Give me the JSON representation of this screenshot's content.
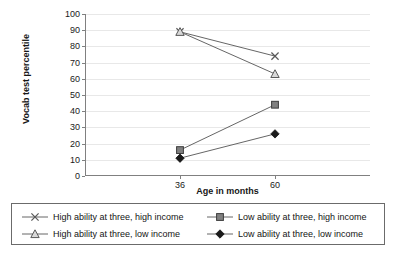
{
  "chart_data": {
    "type": "line",
    "title": "",
    "xlabel": "Age in months",
    "ylabel": "Vocab test percentile",
    "categories": [
      "36",
      "60"
    ],
    "x": [
      36,
      60
    ],
    "ylim": [
      0,
      100
    ],
    "y_ticks": [
      0,
      10,
      20,
      30,
      40,
      50,
      60,
      70,
      80,
      90,
      100
    ],
    "grid": true,
    "legend_position": "bottom",
    "series": [
      {
        "name": "High ability at three, high income",
        "marker": "x",
        "color": "#595959",
        "values": [
          89,
          74
        ]
      },
      {
        "name": "Low ability at three, high income",
        "marker": "square",
        "color": "#808080",
        "values": [
          16,
          44
        ]
      },
      {
        "name": "High ability at three, low income",
        "marker": "triangle",
        "color": "#8c8c8c",
        "values": [
          89,
          63
        ]
      },
      {
        "name": "Low ability at three, low income",
        "marker": "diamond",
        "color": "#1a1a1a",
        "values": [
          11,
          26
        ]
      }
    ]
  },
  "legend": {
    "rows": [
      [
        {
          "label": "High ability at three, high income",
          "marker": "x"
        },
        {
          "label": "Low ability at three, high income",
          "marker": "square"
        }
      ],
      [
        {
          "label": "High ability at three, low income",
          "marker": "triangle"
        },
        {
          "label": "Low ability at three, low income",
          "marker": "diamond"
        }
      ]
    ]
  },
  "axis": {
    "y_tick_labels": [
      "100",
      "90",
      "80",
      "70",
      "60",
      "50",
      "40",
      "30",
      "20",
      "10",
      "0"
    ],
    "x_tick_labels": [
      "36",
      "60"
    ],
    "y_title": "Vocab test percentile",
    "x_title": "Age in months"
  }
}
